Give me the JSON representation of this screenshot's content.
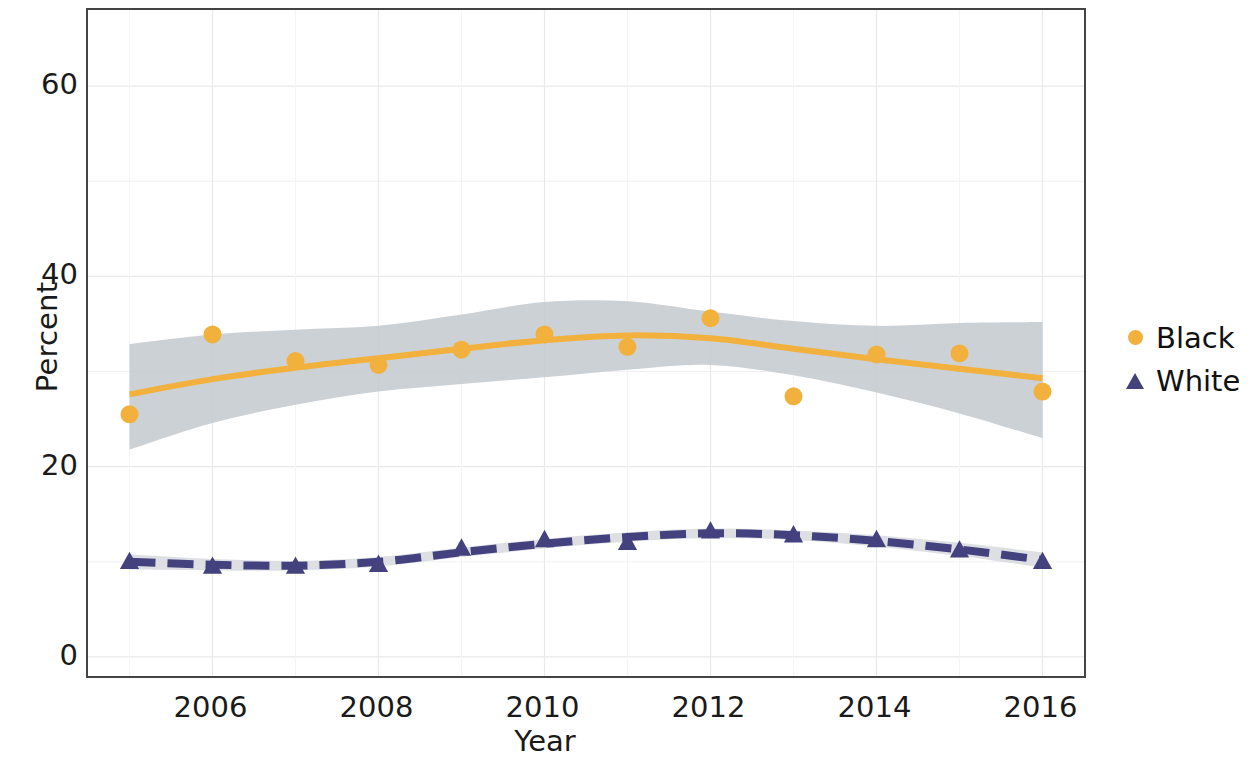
{
  "chart_data": {
    "type": "line",
    "title": "",
    "xlabel": "Year",
    "ylabel": "Percent",
    "xlim": [
      2004.5,
      2016.5
    ],
    "ylim": [
      -2,
      68
    ],
    "grid": true,
    "x_ticks": [
      "2006",
      "2008",
      "2010",
      "2012",
      "2014",
      "2016"
    ],
    "x_tick_values": [
      2006,
      2008,
      2010,
      2012,
      2014,
      2016
    ],
    "y_ticks": [
      "0",
      "20",
      "40",
      "60"
    ],
    "y_tick_values": [
      0,
      20,
      40,
      60
    ],
    "y_minor_gridlines": [
      10,
      30,
      50
    ],
    "legend_position": "right",
    "x": [
      2005,
      2006,
      2007,
      2008,
      2009,
      2010,
      2011,
      2012,
      2013,
      2014,
      2015,
      2016
    ],
    "series": [
      {
        "name": "Black",
        "color": "#F2B13C",
        "marker": "circle",
        "linestyle": "solid",
        "has_confidence_band": true,
        "band_color": "#C3C9CE",
        "values": [
          25.5,
          33.9,
          31.1,
          30.7,
          32.3,
          33.9,
          32.6,
          35.6,
          27.4,
          31.8,
          31.9,
          27.9
        ],
        "smooth_fit": [
          27.6,
          29.2,
          30.4,
          31.4,
          32.4,
          33.3,
          33.8,
          33.5,
          32.4,
          31.3,
          30.3,
          29.3
        ],
        "band_upper": [
          32.9,
          33.9,
          34.4,
          34.8,
          36.0,
          37.3,
          37.4,
          36.3,
          35.3,
          34.8,
          35.1,
          35.2
        ],
        "band_lower": [
          21.8,
          24.6,
          26.5,
          27.9,
          28.7,
          29.4,
          30.2,
          30.7,
          29.6,
          27.8,
          25.6,
          23.0
        ]
      },
      {
        "name": "White",
        "color": "#43417E",
        "marker": "triangle",
        "linestyle": "dashed",
        "has_confidence_band": true,
        "band_color": "#D9DCE0",
        "values": [
          10.0,
          9.5,
          9.5,
          9.7,
          11.4,
          12.3,
          12.0,
          13.2,
          12.8,
          12.3,
          11.2,
          10.0
        ],
        "smooth_fit": [
          10.0,
          9.7,
          9.6,
          10.0,
          11.0,
          11.9,
          12.6,
          13.0,
          12.8,
          12.2,
          11.3,
          10.2
        ],
        "band_upper": [
          10.8,
          10.3,
          10.1,
          10.5,
          11.5,
          12.4,
          13.1,
          13.5,
          13.3,
          12.8,
          12.0,
          11.0
        ],
        "band_lower": [
          9.2,
          9.1,
          9.1,
          9.5,
          10.5,
          11.4,
          12.1,
          12.5,
          12.3,
          11.6,
          10.6,
          9.4
        ]
      }
    ]
  },
  "legend": {
    "items": [
      {
        "label": "Black",
        "marker": "circle",
        "color": "#F2B13C"
      },
      {
        "label": "White",
        "marker": "triangle",
        "color": "#43417E"
      }
    ]
  }
}
